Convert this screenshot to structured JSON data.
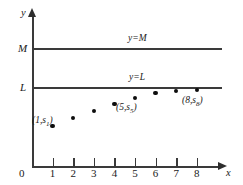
{
  "figure": {
    "axes": {
      "x_axis_label": "x",
      "y_axis_label": "y",
      "origin_label": "0",
      "x_ticks": [
        "1",
        "2",
        "3",
        "4",
        "5",
        "6",
        "7",
        "8"
      ],
      "y_ticks": [
        "M",
        "L"
      ]
    },
    "lines": [
      {
        "id": "M",
        "label": "y=M",
        "value_label": "M"
      },
      {
        "id": "L",
        "label": "y=L",
        "value_label": "L"
      }
    ],
    "point_annotations": {
      "p1_prefix": "(1,",
      "p1_sub": "1",
      "p1_suffix": ")",
      "p1_var": "s",
      "p5_prefix": "(5,",
      "p5_sub": "5",
      "p5_suffix": ")",
      "p5_var": "s",
      "p8_prefix": "(8,",
      "p8_sub": "8",
      "p8_suffix": ")",
      "p8_var": "s"
    },
    "colors": {
      "line": "#3a3a3a",
      "point": "#0d0d0d",
      "text": "#1a1a1a",
      "background": "#ffffff"
    }
  },
  "chart_data": {
    "type": "scatter",
    "title": "",
    "xlabel": "x",
    "ylabel": "y",
    "x": [
      1,
      2,
      3,
      4,
      5,
      6,
      7,
      8
    ],
    "values": [
      126,
      118,
      111,
      104,
      98,
      93,
      91,
      90
    ],
    "series": [
      {
        "name": "s_n",
        "x": [
          1,
          2,
          3,
          4,
          5,
          6,
          7,
          8
        ],
        "y_pixels": [
          126,
          118,
          111,
          104,
          98,
          93,
          91,
          90
        ]
      }
    ],
    "hlines": [
      {
        "label": "y=M",
        "y_pixel": 48
      },
      {
        "label": "y=L",
        "y_pixel": 87
      }
    ],
    "xlim": [
      0,
      8.8
    ],
    "grid": false,
    "legend": "none",
    "annotations": [
      "(1,s1)",
      "(5,s5)",
      "(8,s8)",
      "y=M",
      "y=L"
    ]
  }
}
